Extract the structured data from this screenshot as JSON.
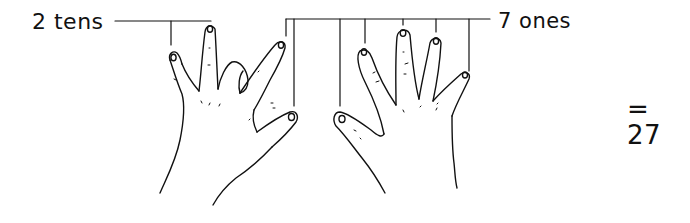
{
  "diagram": {
    "tens": {
      "count": "2",
      "unit": "tens",
      "label": "2 tens"
    },
    "ones": {
      "count": "7",
      "unit": "ones",
      "label": "7 ones"
    },
    "result": {
      "label": "= 27",
      "value": "27"
    },
    "line_color": "#111111",
    "background": "#ffffff",
    "left_hand": {
      "extended_fingers": [
        "index",
        "middle",
        "ring(bent)",
        "little",
        "thumb"
      ],
      "role": "tens bracket points to index and middle"
    },
    "right_hand": {
      "extended_fingers": [
        "thumb",
        "index",
        "middle",
        "ring",
        "little"
      ],
      "role": "ones bracket points to all five fingers plus left thumb and left little finger"
    }
  }
}
